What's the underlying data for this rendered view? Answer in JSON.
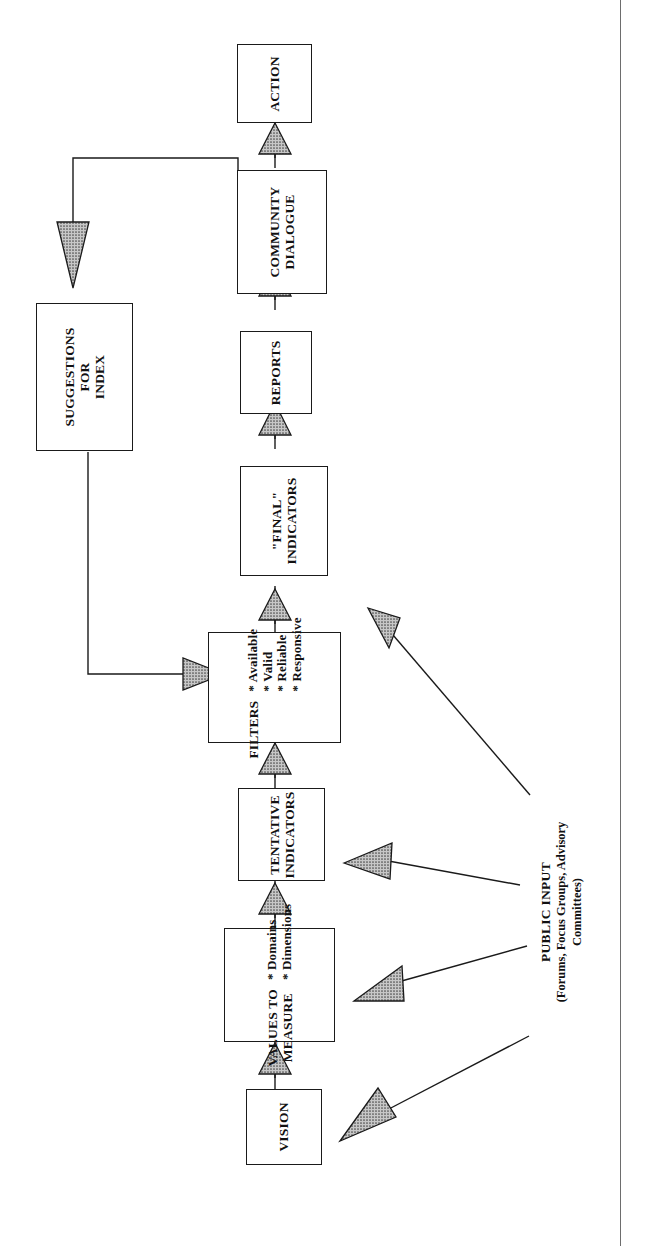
{
  "diagram": {
    "orientation": "rotated-90-ccw",
    "nodes": [
      {
        "id": "action",
        "label": "ACTION",
        "lines": [
          "ACTION"
        ]
      },
      {
        "id": "community-dialogue",
        "label": "COMMUNITY DIALOGUE",
        "lines": [
          "COMMUNITY",
          "DIALOGUE"
        ]
      },
      {
        "id": "reports",
        "label": "REPORTS",
        "lines": [
          "REPORTS"
        ]
      },
      {
        "id": "final-indicators",
        "label": "\"FINAL\" INDICATORS",
        "lines": [
          "\"FINAL\"",
          "INDICATORS"
        ]
      },
      {
        "id": "filters",
        "label": "FILTERS",
        "lines": [
          "FILTERS"
        ],
        "bullets": [
          "* Available",
          "* Valid",
          "* Reliable",
          "* Responsive"
        ]
      },
      {
        "id": "tentative-indicators",
        "label": "TENTATIVE INDICATORS",
        "lines": [
          "TENTATIVE",
          "INDICATORS"
        ]
      },
      {
        "id": "values-to-measure",
        "label": "VALUES TO MEASURE",
        "lines": [
          "VALUES TO",
          "MEASURE"
        ],
        "bullets": [
          "* Domains",
          "* Dimensions"
        ]
      },
      {
        "id": "vision",
        "label": "VISION",
        "lines": [
          "VISION"
        ]
      },
      {
        "id": "suggestions-for-index",
        "label": "SUGGESTIONS FOR INDEX",
        "lines": [
          "SUGGESTIONS",
          "FOR",
          "INDEX"
        ]
      }
    ],
    "annotation": {
      "id": "public-input",
      "title": "PUBLIC INPUT",
      "subtitle_line1": "(Forums, Focus Groups, Advisory",
      "subtitle_line2": "Committees)"
    },
    "colors": {
      "stroke": "#1a1a1a",
      "arrow_fill": "#8c8c8c",
      "background": "#ffffff",
      "page_border": "#6d6d6d"
    },
    "edges": [
      {
        "from": "vision",
        "to": "values-to-measure"
      },
      {
        "from": "values-to-measure",
        "to": "tentative-indicators"
      },
      {
        "from": "tentative-indicators",
        "to": "filters"
      },
      {
        "from": "filters",
        "to": "final-indicators"
      },
      {
        "from": "final-indicators",
        "to": "reports"
      },
      {
        "from": "reports",
        "to": "community-dialogue"
      },
      {
        "from": "community-dialogue",
        "to": "action"
      },
      {
        "from": "community-dialogue",
        "to": "suggestions-for-index"
      },
      {
        "from": "suggestions-for-index",
        "to": "filters"
      },
      {
        "from": "public-input",
        "to": "vision"
      },
      {
        "from": "public-input",
        "to": "values-to-measure"
      },
      {
        "from": "public-input",
        "to": "tentative-indicators"
      },
      {
        "from": "public-input",
        "to": "filters"
      }
    ]
  }
}
